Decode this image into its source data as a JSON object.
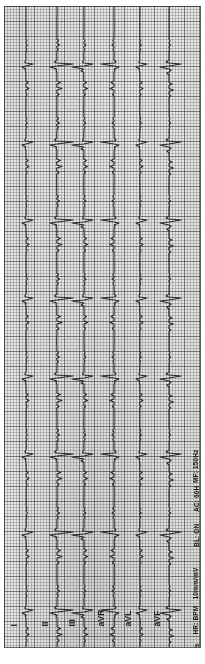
{
  "document": {
    "type": "electrocardiogram",
    "title": "12-Lead ECG Strip",
    "orientation": "rotated-90"
  },
  "leads": [
    {
      "id": "lead-i",
      "label": "I"
    },
    {
      "id": "lead-ii",
      "label": "II"
    },
    {
      "id": "lead-iii",
      "label": "III"
    },
    {
      "id": "lead-avr",
      "label": "aVR"
    },
    {
      "id": "lead-avl",
      "label": "aVL"
    },
    {
      "id": "lead-avf",
      "label": "aVF"
    }
  ],
  "settings": [
    {
      "id": "paper-speed",
      "label": "25mm/s"
    },
    {
      "id": "heart-rate",
      "label": "HR:  BPM"
    },
    {
      "id": "gain",
      "label": "10mm/mV"
    },
    {
      "id": "baseline-filter",
      "label": "BL: ON"
    },
    {
      "id": "ac-filter",
      "label": "AC: 60H"
    },
    {
      "id": "muscle-filter",
      "label": "MF: 150Hz"
    }
  ],
  "colors": {
    "paper": "#e9e9e7",
    "grid_major": "#464646",
    "grid_minor": "#787876",
    "trace": "#2b2b2b",
    "page": "#ffffff"
  },
  "chart_data": {
    "type": "line",
    "xlabel": "",
    "ylabel": "",
    "grid": true,
    "legend": "none",
    "orientation": "vertical-traces-rotated-90",
    "paper_speed_mm_per_s": 25,
    "gain_mm_per_mV": 10,
    "grid_minor_px": 3,
    "grid_major_px": 15,
    "axis_note": "Time runs top-to-bottom; amplitude deflects left-right from each lead baseline.",
    "series": [
      {
        "name": "I",
        "baseline_x": 22,
        "amplitude_scale": 1.0
      },
      {
        "name": "II",
        "baseline_x": 53,
        "amplitude_scale": 1.0
      },
      {
        "name": "III",
        "baseline_x": 80,
        "amplitude_scale": 1.0
      },
      {
        "name": "aVR",
        "baseline_x": 110,
        "amplitude_scale": 1.0
      },
      {
        "name": "aVL",
        "baseline_x": 136,
        "amplitude_scale": 1.0
      },
      {
        "name": "aVF",
        "baseline_x": 165,
        "amplitude_scale": 1.0
      }
    ],
    "beat_times_px": [
      30,
      108,
      186,
      264,
      342,
      420,
      498,
      576
    ],
    "beat_interval_px": 78
  }
}
